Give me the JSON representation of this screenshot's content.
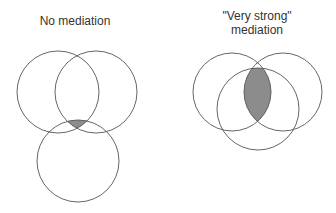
{
  "panels": [
    {
      "title": "No mediation",
      "circles": [
        {
          "cx": 58,
          "cy": 92,
          "r": 41
        },
        {
          "cx": 96,
          "cy": 92,
          "r": 41
        },
        {
          "cx": 78,
          "cy": 161,
          "r": 41
        }
      ],
      "shaded": "triple-intersection-small"
    },
    {
      "title_line1": "\"Very strong\"",
      "title_line2": "mediation",
      "circles": [
        {
          "cx": 232,
          "cy": 92,
          "r": 39
        },
        {
          "cx": 283,
          "cy": 92,
          "r": 39
        },
        {
          "cx": 258,
          "cy": 109,
          "r": 41
        }
      ],
      "shaded": "triple-intersection-large"
    }
  ],
  "colors": {
    "stroke": "#555555",
    "fill": "#8c8c8c"
  }
}
